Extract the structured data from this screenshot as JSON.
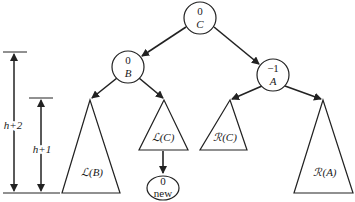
{
  "diagram": {
    "type": "AVL tree rotation (double rotation case)",
    "nodes": [
      {
        "id": "C",
        "balance": "0",
        "name": "C"
      },
      {
        "id": "B",
        "balance": "0",
        "name": "B"
      },
      {
        "id": "A",
        "balance": "−1",
        "name": "A"
      },
      {
        "id": "new",
        "balance": "0",
        "name": "new"
      }
    ],
    "subtrees": [
      {
        "id": "LB",
        "label": "ℒ(B)"
      },
      {
        "id": "LC",
        "label": "ℒ(C)"
      },
      {
        "id": "RC",
        "label": "ℛ(C)"
      },
      {
        "id": "RA",
        "label": "ℛ(A)"
      }
    ],
    "dimensions": [
      {
        "id": "h2",
        "label": "h+2"
      },
      {
        "id": "h1",
        "label": "h+1"
      }
    ],
    "colors": {
      "stroke": "#222222",
      "background": "#ffffff"
    }
  }
}
